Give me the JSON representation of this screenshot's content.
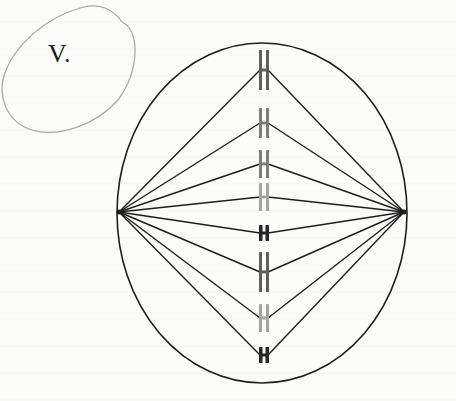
{
  "figure": {
    "label": "V.",
    "colors": {
      "outline": "#1e1e1e",
      "annotation_oval": "#a8a8a8",
      "chromosome_dark": "#262626",
      "chromosome_mid": "#5f5f5f",
      "chromosome_gray": "#7d7d7d",
      "chromosome_light": "#a3a3a3"
    },
    "cell": {
      "cx": 262,
      "cy": 213,
      "rx": 145,
      "ry": 170
    },
    "poles": [
      {
        "name": "left-pole",
        "x": 119,
        "y": 212
      },
      {
        "name": "right-pole",
        "x": 404,
        "y": 212
      }
    ],
    "chromosomes": [
      {
        "cy": 70,
        "len": 40,
        "tone": "mid"
      },
      {
        "cy": 123,
        "len": 30,
        "tone": "gray"
      },
      {
        "cy": 164,
        "len": 28,
        "tone": "gray"
      },
      {
        "cy": 197,
        "len": 28,
        "tone": "light"
      },
      {
        "cy": 233,
        "len": 16,
        "tone": "dark"
      },
      {
        "cy": 272,
        "len": 40,
        "tone": "mid"
      },
      {
        "cy": 318,
        "len": 28,
        "tone": "light"
      },
      {
        "cy": 355,
        "len": 16,
        "tone": "dark"
      }
    ]
  }
}
